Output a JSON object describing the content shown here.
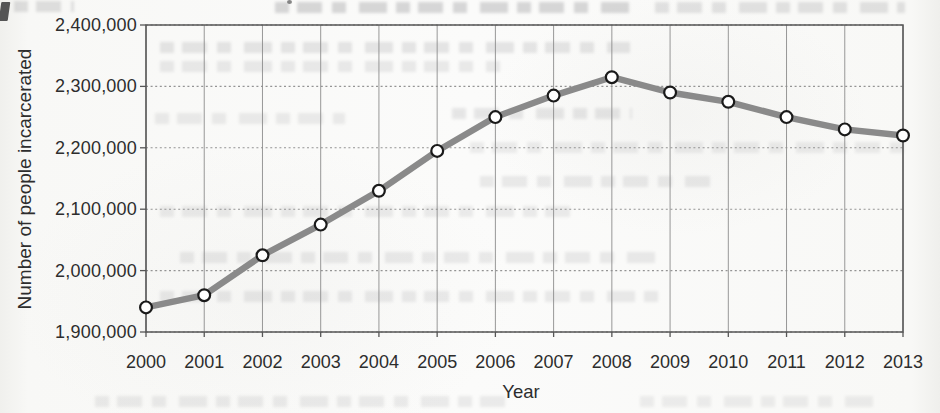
{
  "chart_data": {
    "type": "line",
    "title": "",
    "xlabel": "Year",
    "ylabel": "Number of people incarcerated",
    "x": [
      2000,
      2001,
      2002,
      2003,
      2004,
      2005,
      2006,
      2007,
      2008,
      2009,
      2010,
      2011,
      2012,
      2013
    ],
    "values": [
      1940000,
      1960000,
      2025000,
      2075000,
      2130000,
      2195000,
      2250000,
      2285000,
      2315000,
      2290000,
      2275000,
      2250000,
      2230000,
      2220000
    ],
    "ylim": [
      1900000,
      2400000
    ],
    "y_tick_step": 100000,
    "y_tick_labels": [
      "1,900,000",
      "2,000,000",
      "2,100,000",
      "2,200,000",
      "2,300,000",
      "2,400,000"
    ],
    "grid": true,
    "legend": "none",
    "colors": {
      "line": "#8a8a8a",
      "marker_fill": "#ffffff",
      "marker_stroke": "#1a1a1a",
      "grid_vertical": "#868686",
      "grid_horizontal": "#8f8f8f",
      "border": "#565656",
      "text": "#2d2d2d",
      "paper": "#f9f9f7"
    }
  }
}
